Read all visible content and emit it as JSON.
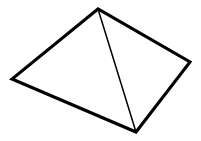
{
  "figure": {
    "kind": "line-drawing",
    "background_color": "#ffffff",
    "stroke_color": "#000000",
    "outline_stroke_width": 3.1,
    "interior_stroke_width": 1.5,
    "canvas": {
      "width": 201,
      "height": 141
    },
    "vertices": [
      {
        "name": "apex",
        "x": 98,
        "y": 9
      },
      {
        "name": "left-base-corner",
        "x": 12,
        "y": 79
      },
      {
        "name": "right-base-corner",
        "x": 190,
        "y": 62
      },
      {
        "name": "front-base-corner",
        "x": 136,
        "y": 132
      }
    ],
    "edges": [
      {
        "name": "apex-to-left-edge",
        "from": "apex",
        "to": "left-base-corner",
        "style": "outline"
      },
      {
        "name": "left-to-front-edge",
        "from": "left-base-corner",
        "to": "front-base-corner",
        "style": "outline"
      },
      {
        "name": "front-to-right-edge",
        "from": "front-base-corner",
        "to": "right-base-corner",
        "style": "outline"
      },
      {
        "name": "right-to-apex-edge",
        "from": "right-base-corner",
        "to": "apex",
        "style": "outline"
      },
      {
        "name": "apex-to-front-edge",
        "from": "apex",
        "to": "front-base-corner",
        "style": "interior"
      }
    ],
    "faces": [
      {
        "name": "left-face",
        "points": "98,9 12,79 136,132"
      },
      {
        "name": "right-face",
        "points": "98,9 136,132 190,62"
      }
    ],
    "outline_path": "M 98 9 L 12 79 L 136 132 L 190 62 Z",
    "interior_path": "M 98 9 L 136 132"
  }
}
